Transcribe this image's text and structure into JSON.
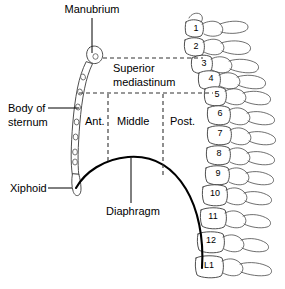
{
  "figure": {
    "background_color": "#ffffff",
    "line_color": "#000000",
    "bone_outline_color": "#3a3a3a"
  },
  "labels": {
    "manubrium": "Manubrium",
    "superior_mediastinum_line1": "Superior",
    "superior_mediastinum_line2": "mediastinum",
    "body_of_sternum_line1": "Body of",
    "body_of_sternum_line2": "sternum",
    "xiphoid": "Xiphoid",
    "diaphragm": "Diaphragm"
  },
  "compartments": {
    "anterior": "Ant.",
    "middle": "Middle",
    "posterior": "Post."
  },
  "vertebrae": [
    {
      "label": "1",
      "x": 196,
      "y": 31
    },
    {
      "label": "2",
      "x": 196,
      "y": 49
    },
    {
      "label": "3",
      "x": 204,
      "y": 66
    },
    {
      "label": "4",
      "x": 211,
      "y": 81
    },
    {
      "label": "5",
      "x": 217,
      "y": 97
    },
    {
      "label": "6",
      "x": 220,
      "y": 116
    },
    {
      "label": "7",
      "x": 220,
      "y": 136
    },
    {
      "label": "8",
      "x": 219,
      "y": 156
    },
    {
      "label": "9",
      "x": 218,
      "y": 176
    },
    {
      "label": "10",
      "x": 215,
      "y": 196
    },
    {
      "label": "11",
      "x": 213,
      "y": 219
    },
    {
      "label": "12",
      "x": 211,
      "y": 243
    },
    {
      "label": "L1",
      "x": 209,
      "y": 268
    }
  ]
}
